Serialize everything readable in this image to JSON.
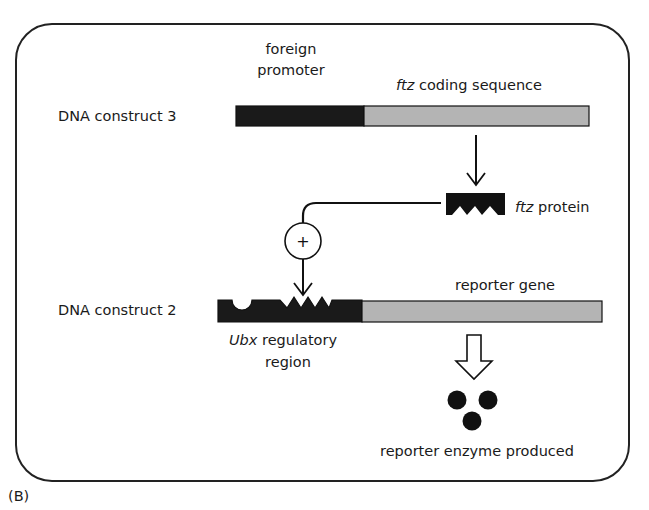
{
  "panel_label": "(B)",
  "colors": {
    "frame": "#222222",
    "promoter_fill": "#1a1a1a",
    "coding_fill": "#b4b4b4",
    "protein_fill": "#111111",
    "enzyme_fill": "#111111"
  },
  "construct3": {
    "label": "DNA construct 3",
    "promoter_label_line1": "foreign",
    "promoter_label_line2": "promoter",
    "coding_label_gene": "ftz",
    "coding_label_rest": " coding sequence"
  },
  "protein": {
    "label_gene": "ftz",
    "label_rest": " protein"
  },
  "activation": {
    "symbol": "+"
  },
  "construct2": {
    "label": "DNA construct 2",
    "regulatory_label_gene": "Ubx",
    "regulatory_label_rest": " regulatory",
    "regulatory_label_line2": "region",
    "reporter_label": "reporter gene"
  },
  "output": {
    "label": "reporter enzyme produced",
    "enzyme_count": 3
  }
}
